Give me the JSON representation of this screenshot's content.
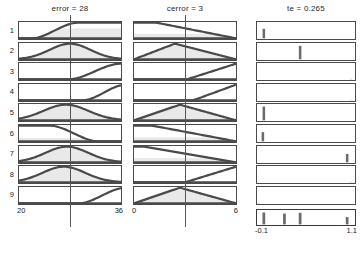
{
  "window": {
    "title": "Rule Viewer",
    "kind": "fuzzy-rule-viewer"
  },
  "layout": {
    "rule_count": 9,
    "row_labels": [
      "1",
      "2",
      "3",
      "4",
      "5",
      "6",
      "7",
      "8",
      "9"
    ],
    "has_aggregate_row": true
  },
  "colors": {
    "curve": "#4a4a4a",
    "fill": "#e9e9e9",
    "bar": "#6b6b6b",
    "frame": "#4a4a4a",
    "indicator": "#555555",
    "background": "#ffffff",
    "text": "#1a1a1a"
  },
  "columns": [
    {
      "id": "error",
      "variable": "error",
      "title": "error = 28",
      "value": 28,
      "axis_min_label": "20",
      "axis_max_label": "36",
      "axis_min": 20,
      "axis_max": 36,
      "indicator_pos": 0.5,
      "kind": "input"
    },
    {
      "id": "cerror",
      "variable": "cerror",
      "title": "cerror = 3",
      "value": 3,
      "axis_min_label": "0",
      "axis_max_label": "6",
      "axis_min": 0,
      "axis_max": 6,
      "indicator_pos": 0.5,
      "kind": "input"
    },
    {
      "id": "te",
      "variable": "te",
      "title": "te = 0.265",
      "value": 0.265,
      "axis_min_label": "-0.1",
      "axis_max_label": "1.1",
      "axis_min": -0.1,
      "axis_max": 1.1,
      "kind": "output"
    }
  ],
  "chart_data": {
    "type": "line",
    "xlabel": "",
    "ylabel": "",
    "grid": false,
    "legend": "none",
    "inputs": [
      {
        "name": "error",
        "value": 28,
        "range": [
          20,
          36
        ]
      },
      {
        "name": "cerror",
        "value": 3,
        "range": [
          0,
          6
        ]
      }
    ],
    "output": {
      "name": "te",
      "value": 0.265,
      "range": [
        -0.1,
        1.1
      ]
    },
    "rules": [
      {
        "rule": 1,
        "error_mf": "sigmoid-up",
        "error_shape": "s-rise",
        "error_p": [
          0.12,
          0.58
        ],
        "error_clip": 0.62,
        "cerror_mf": "ramp-down",
        "cerror_shape": "ramp-down",
        "cerror_p": [
          0.22,
          1.0
        ],
        "cerror_clip": 0.3,
        "te_centroid": 0.07,
        "te_strength": 0.62
      },
      {
        "rule": 2,
        "error_mf": "bell",
        "error_shape": "bell",
        "error_p": [
          0.5,
          0.2
        ],
        "error_clip": 1.0,
        "cerror_mf": "triangle",
        "cerror_shape": "tri",
        "cerror_p": [
          0.0,
          0.4,
          1.0
        ],
        "cerror_clip": 0.88,
        "te_centroid": 0.44,
        "te_strength": 0.88
      },
      {
        "rule": 3,
        "error_mf": "sigmoid-up",
        "error_shape": "s-rise",
        "error_p": [
          0.48,
          1.0
        ],
        "error_clip": 0.04,
        "cerror_mf": "ramp-up",
        "cerror_shape": "ramp-up",
        "cerror_p": [
          0.52,
          1.0
        ],
        "cerror_clip": 0.03,
        "te_centroid": 0.96,
        "te_strength": 0.03
      },
      {
        "rule": 4,
        "error_mf": "sigmoid-up",
        "error_shape": "s-rise",
        "error_p": [
          0.62,
          1.05
        ],
        "error_clip": 0.02,
        "cerror_mf": "ramp-up",
        "cerror_shape": "ramp-up",
        "cerror_p": [
          0.58,
          1.0
        ],
        "cerror_clip": 0.02,
        "te_centroid": 0.96,
        "te_strength": 0.02
      },
      {
        "rule": 5,
        "error_mf": "bell",
        "error_shape": "bell",
        "error_p": [
          0.46,
          0.22
        ],
        "error_clip": 1.0,
        "cerror_mf": "triangle",
        "cerror_shape": "tri",
        "cerror_p": [
          0.0,
          0.45,
          1.0
        ],
        "cerror_clip": 0.9,
        "te_centroid": 0.07,
        "te_strength": 0.9
      },
      {
        "rule": 6,
        "error_mf": "sigmoid-down",
        "error_shape": "s-fall",
        "error_p": [
          0.3,
          0.78
        ],
        "error_clip": 0.22,
        "cerror_mf": "ramp-down",
        "cerror_shape": "ramp-down",
        "cerror_p": [
          0.18,
          1.0
        ],
        "cerror_clip": 0.26,
        "te_centroid": 0.06,
        "te_strength": 0.6
      },
      {
        "rule": 7,
        "error_mf": "bell",
        "error_shape": "bell",
        "error_p": [
          0.47,
          0.21
        ],
        "error_clip": 1.0,
        "cerror_mf": "ramp-down",
        "cerror_shape": "ramp-down",
        "cerror_p": [
          0.1,
          1.0
        ],
        "cerror_clip": 0.28,
        "te_centroid": 0.92,
        "te_strength": 0.55
      },
      {
        "rule": 8,
        "error_mf": "bell",
        "error_shape": "bell",
        "error_p": [
          0.44,
          0.21
        ],
        "error_clip": 1.0,
        "cerror_mf": "ramp-up",
        "cerror_shape": "ramp-up",
        "cerror_p": [
          0.5,
          1.0
        ],
        "cerror_clip": 0.03,
        "te_centroid": 0.96,
        "te_strength": 0.03
      },
      {
        "rule": 9,
        "error_mf": "sigmoid-up",
        "error_shape": "s-rise",
        "error_p": [
          0.58,
          1.05
        ],
        "error_clip": 0.03,
        "cerror_mf": "triangle",
        "cerror_shape": "tri",
        "cerror_p": [
          0.0,
          0.45,
          1.0
        ],
        "cerror_clip": 0.86,
        "te_centroid": 0.02,
        "te_strength": 0.03
      }
    ],
    "aggregate_bars": [
      {
        "pos": 0.07,
        "height": 0.9
      },
      {
        "pos": 0.28,
        "height": 0.82
      },
      {
        "pos": 0.44,
        "height": 0.88
      },
      {
        "pos": 0.92,
        "height": 0.55
      }
    ],
    "defuzzified": 0.265
  }
}
